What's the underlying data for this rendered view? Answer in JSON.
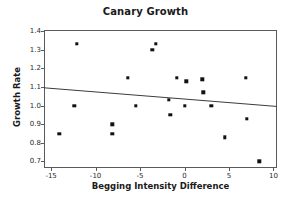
{
  "chart_data": {
    "type": "scatter",
    "title": "Canary Growth",
    "xlabel": "Begging Intensity Difference",
    "ylabel": "Growth Rate",
    "xlim": [
      -15.8,
      10.4
    ],
    "ylim": [
      0.665,
      1.405
    ],
    "xticks": [
      -15,
      -10,
      -5,
      0,
      5,
      10
    ],
    "xtick_labels": [
      "-15",
      "-10",
      "-5",
      "0",
      "5",
      "10"
    ],
    "yticks": [
      0.7,
      0.8,
      0.9,
      1.0,
      1.1,
      1.2,
      1.3,
      1.4
    ],
    "ytick_labels": [
      "0.7",
      "0.8",
      "0.9",
      "1.0",
      "1.1",
      "1.2",
      "1.3",
      "1.4"
    ],
    "grid": false,
    "legend": "none",
    "marker": "square",
    "marker_color": "#111111",
    "points": [
      {
        "x": -14.1,
        "y": 0.85
      },
      {
        "x": -12.1,
        "y": 1.33
      },
      {
        "x": -12.4,
        "y": 1.0
      },
      {
        "x": -8.1,
        "y": 0.9
      },
      {
        "x": -8.1,
        "y": 0.85
      },
      {
        "x": -6.4,
        "y": 1.15
      },
      {
        "x": -5.5,
        "y": 1.0
      },
      {
        "x": -3.6,
        "y": 1.3
      },
      {
        "x": -3.2,
        "y": 1.33
      },
      {
        "x": -1.8,
        "y": 1.03
      },
      {
        "x": -1.6,
        "y": 0.95
      },
      {
        "x": -0.9,
        "y": 1.15
      },
      {
        "x": 0.0,
        "y": 1.0
      },
      {
        "x": 0.2,
        "y": 1.13
      },
      {
        "x": 2.0,
        "y": 1.14
      },
      {
        "x": 2.1,
        "y": 1.07
      },
      {
        "x": 3.0,
        "y": 1.0
      },
      {
        "x": 4.5,
        "y": 0.83
      },
      {
        "x": 6.9,
        "y": 1.15
      },
      {
        "x": 7.0,
        "y": 0.93
      },
      {
        "x": 8.4,
        "y": 0.7
      }
    ],
    "trend_line": {
      "type": "linear-fit",
      "color": "#3c3c3c",
      "x_start": -15.8,
      "y_start": 1.095,
      "x_end": 10.4,
      "y_end": 0.995
    }
  }
}
